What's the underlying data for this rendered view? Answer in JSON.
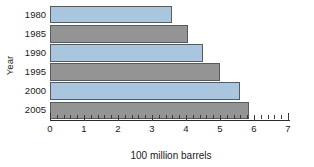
{
  "chart_data": {
    "type": "bar",
    "orientation": "horizontal",
    "title": "",
    "xlabel": "100 million barrels",
    "ylabel": "Year",
    "categories": [
      "1980",
      "1985",
      "1990",
      "1995",
      "2000",
      "2005"
    ],
    "values": [
      3.6,
      4.05,
      4.5,
      5.0,
      5.6,
      5.85
    ],
    "xlim": [
      0,
      7
    ],
    "ylim": null,
    "xticks": [
      0,
      1,
      2,
      3,
      4,
      5,
      6,
      7
    ],
    "xticklabels": [
      "0",
      "1",
      "2",
      "3",
      "4",
      "5",
      "6",
      "7"
    ],
    "minor_ticks_per_interval": 5,
    "grid": false,
    "legend": null,
    "bar_colors": [
      "#a9c6de",
      "#949494",
      "#a9c6de",
      "#949494",
      "#a9c6de",
      "#949494"
    ],
    "bar_edge_color": "#555b60",
    "axis_color": "#2b2b2b"
  },
  "axes": {
    "y_title": "Year",
    "x_title": "100 million barrels"
  }
}
